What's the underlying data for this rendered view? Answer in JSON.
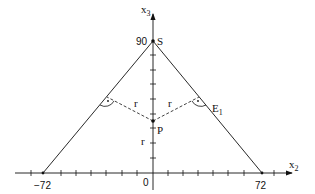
{
  "diagram": {
    "axes": {
      "x_axis_label": "x",
      "x_axis_sub": "2",
      "y_axis_label": "x",
      "y_axis_sub": "3",
      "origin_label": "0"
    },
    "tick_labels": {
      "x_left": "−72",
      "x_right": "72",
      "y_top": "90"
    },
    "points": {
      "apex": "S",
      "center": "P",
      "plane": "E",
      "plane_sub": "1"
    },
    "radius_label": "r",
    "right_angle_mark": "·"
  }
}
